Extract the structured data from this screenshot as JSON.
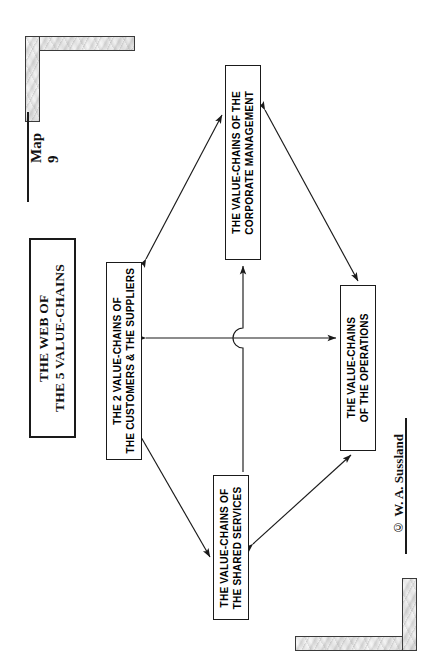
{
  "page": {
    "map_label": "Map 9",
    "copyright": "© W. A. Sussland",
    "width": 435,
    "height": 667,
    "background": "#ffffff",
    "ink": "#1a1a1a"
  },
  "title_box": {
    "line1": "THE WEB OF",
    "line2": "THE 5 VALUE-CHAINS",
    "text": "THE WEB OF\nTHE 5 VALUE-CHAINS"
  },
  "nodes": [
    {
      "id": "customers-suppliers",
      "line1": "THE 2 VALUE-CHAINS OF",
      "line2": "THE CUSTOMERS & THE SUPPLIERS",
      "text": "THE 2 VALUE-CHAINS OF\nTHE CUSTOMERS & THE SUPPLIERS"
    },
    {
      "id": "corporate-management",
      "line1": "THE VALUE-CHAINS OF THE",
      "line2": "CORPORATE MANAGEMENT",
      "text": "THE VALUE-CHAINS OF THE\nCORPORATE MANAGEMENT"
    },
    {
      "id": "operations",
      "line1": "THE VALUE-CHAINS",
      "line2": "OF THE OPERATIONS",
      "text": "THE VALUE-CHAINS\nOF THE OPERATIONS"
    },
    {
      "id": "shared-services",
      "line1": "THE VALUE-CHAINS OF",
      "line2": "THE SHARED SERVICES",
      "text": "THE VALUE-CHAINS OF\nTHE SHARED SERVICES"
    }
  ],
  "connectors": [
    {
      "id": "customers-to-corporate",
      "from": "customers-suppliers",
      "to": "corporate-management",
      "style": "double-headed-diagonal"
    },
    {
      "id": "corporate-to-operations",
      "from": "corporate-management",
      "to": "operations",
      "style": "double-headed-diagonal"
    },
    {
      "id": "customers-to-shared",
      "from": "customers-suppliers",
      "to": "shared-services",
      "style": "double-headed-diagonal"
    },
    {
      "id": "shared-to-operations",
      "from": "shared-services",
      "to": "operations",
      "style": "double-headed-diagonal"
    },
    {
      "id": "customers-to-operations",
      "from": "customers-suppliers",
      "to": "operations",
      "style": "double-headed-horizontal"
    },
    {
      "id": "shared-to-corporate",
      "from": "shared-services",
      "to": "corporate-management",
      "style": "single-headed-vertical-with-line-jump"
    }
  ],
  "decorations": [
    {
      "id": "top-left-corner-frame",
      "kind": "marble-L-corner"
    },
    {
      "id": "bottom-right-corner-frame",
      "kind": "marble-L-corner"
    }
  ]
}
